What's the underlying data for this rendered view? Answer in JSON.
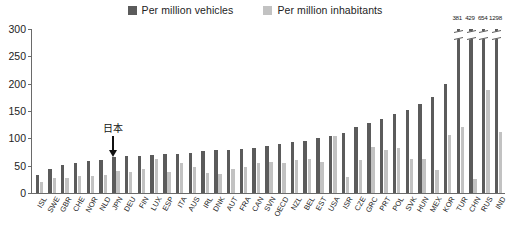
{
  "legend": {
    "items": [
      {
        "label": "Per million vehicles",
        "color": "#5b5b5b",
        "icon": "square-swatch-icon"
      },
      {
        "label": "Per million inhabitants",
        "color": "#c2c2c2",
        "icon": "square-swatch-icon"
      }
    ]
  },
  "annotation": {
    "text": "日本",
    "target": "JPN",
    "icon": "down-arrow-icon"
  },
  "yaxis": {
    "ticks": [
      "0",
      "50",
      "100",
      "150",
      "200",
      "250",
      "300"
    ]
  },
  "chart_data": {
    "type": "bar",
    "title": "",
    "subtitle": "",
    "xlabel": "",
    "ylabel": "",
    "ylim": [
      0,
      300
    ],
    "ytick_step": 50,
    "grid": false,
    "legend_position": "top-center",
    "axis_note": "Four right-most dark bars exceed the axis maximum and are drawn with break marks; their true values are printed above the bars.",
    "categories": [
      "ISL",
      "SWE",
      "GBR",
      "CHE",
      "NOR",
      "NLD",
      "JPN",
      "DEU",
      "FIN",
      "LUX",
      "ESP",
      "ITA",
      "AUS",
      "IRL",
      "DNK",
      "AUT",
      "FRA",
      "CAN",
      "SVN",
      "OECD",
      "NZL",
      "BEL",
      "EST",
      "USA",
      "ISR",
      "CZE",
      "GRC",
      "PRT",
      "POL",
      "SVK",
      "HUN",
      "MEX",
      "KOR",
      "TUR",
      "CHN",
      "RUS",
      "IND"
    ],
    "series": [
      {
        "name": "Per million vehicles",
        "color": "#5b5b5b",
        "values": [
          33,
          44,
          51,
          55,
          58,
          61,
          65,
          67,
          68,
          70,
          71,
          72,
          73,
          76,
          78,
          79,
          81,
          83,
          86,
          90,
          93,
          96,
          100,
          105,
          110,
          120,
          128,
          136,
          144,
          152,
          163,
          175,
          200,
          381,
          429,
          654,
          1298
        ],
        "clipped_indices": [
          33,
          34,
          35,
          36
        ],
        "clipped_labels": [
          "381",
          "429",
          "654",
          "1298"
        ]
      },
      {
        "name": "Per million inhabitants",
        "color": "#c2c2c2",
        "values": [
          20,
          27,
          28,
          31,
          32,
          33,
          40,
          38,
          44,
          62,
          39,
          55,
          48,
          37,
          34,
          44,
          48,
          54,
          57,
          55,
          61,
          63,
          57,
          105,
          30,
          60,
          84,
          78,
          82,
          63,
          62,
          42,
          106,
          120,
          25,
          188,
          112
        ]
      }
    ]
  }
}
